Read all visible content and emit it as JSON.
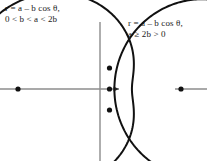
{
  "page": {
    "background": "#ffffff",
    "width": 207,
    "height": 161,
    "ink_color": "#111111",
    "axis_color": "#8c8c8c"
  },
  "figures": [
    {
      "id": "dimpled-limacon",
      "caption_line1": "r = a – b cos θ,",
      "caption_line2": "0 < b < a < 2b",
      "curve_type": "limacon-dimpled",
      "polar_equation": "r = a - b cos(theta)",
      "parameters": {
        "a": 1.0,
        "b": 0.62
      },
      "origin": {
        "x": 100,
        "y": 89
      },
      "scale": 84,
      "axis": {
        "x_axis_from": -100,
        "x_axis_to": 19,
        "y_axis_from": -67,
        "y_axis_to": 72,
        "arrow": "right"
      },
      "marked_points": [
        {
          "label": "upper-dimple-point",
          "x": 9.5,
          "y": -21
        },
        {
          "label": "origin-vertex-point",
          "x": 9.5,
          "y": 0
        },
        {
          "label": "lower-dimple-point",
          "x": 9.5,
          "y": 21
        },
        {
          "label": "left-vertex-point",
          "x": -82,
          "y": 0
        }
      ]
    },
    {
      "id": "convex-limacon",
      "caption_line1": "r = a – b cos θ,",
      "caption_line2": "a ≥ 2b > 0",
      "curve_type": "limacon-convex",
      "polar_equation": "r = a - b cos(theta)",
      "parameters": {
        "a": 1.0,
        "b": 0.4
      },
      "origin": {
        "x": 232,
        "y": 89
      },
      "scale": 84,
      "axis": {
        "x_axis_from": -57,
        "x_axis_to": 10,
        "y_axis_from": -16,
        "y_axis_to": 16,
        "arrow": "none"
      },
      "marked_points": [
        {
          "label": "left-vertex-point",
          "x": -51,
          "y": 0
        }
      ]
    }
  ]
}
